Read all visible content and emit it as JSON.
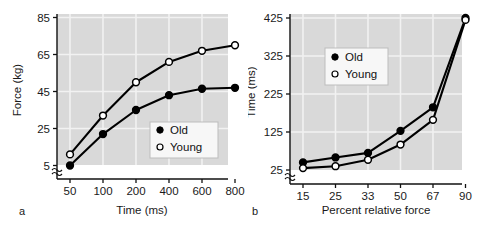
{
  "figure": {
    "background": "#ffffff",
    "plot_background": "#d9d9d9",
    "grid_color": "#f2f2f2",
    "line_color": "#000000"
  },
  "panels": [
    {
      "label": "a",
      "chart_data": {
        "type": "line",
        "title": "",
        "xlabel": "Time (ms)",
        "ylabel": "Force (kg)",
        "categories": [
          "50",
          "100",
          "200",
          "400",
          "600",
          "800"
        ],
        "yticks": [
          "5",
          "25",
          "45",
          "65",
          "85"
        ],
        "ylim": [
          5,
          85
        ],
        "ytick_values": [
          5,
          25,
          45,
          65,
          85
        ],
        "grid": true,
        "axis_break": true,
        "legend_position": "bottom-right",
        "series": [
          {
            "name": "Old",
            "marker": "filled-circle",
            "values": [
              5,
              22,
              35,
              43,
              46.5,
              47
            ]
          },
          {
            "name": "Young",
            "marker": "open-circle",
            "values": [
              11,
              32,
              50,
              61,
              67,
              70
            ]
          }
        ]
      },
      "legend": [
        {
          "label": "Old",
          "marker": "filled-circle"
        },
        {
          "label": "Young",
          "marker": "open-circle"
        }
      ]
    },
    {
      "label": "b",
      "chart_data": {
        "type": "line",
        "title": "",
        "xlabel": "Percent relative force",
        "ylabel": "Time (ms)",
        "categories": [
          "15",
          "25",
          "33",
          "50",
          "67",
          "90"
        ],
        "yticks": [
          "25",
          "125",
          "225",
          "325",
          "425"
        ],
        "ylim": [
          25,
          425
        ],
        "ytick_values": [
          25,
          125,
          225,
          325,
          425
        ],
        "grid": true,
        "axis_break": true,
        "legend_position": "top-center",
        "series": [
          {
            "name": "Old",
            "marker": "filled-circle",
            "values": [
              45,
              58,
              70,
              128,
              190,
              425
            ]
          },
          {
            "name": "Young",
            "marker": "open-circle",
            "values": [
              30,
              35,
              52,
              92,
              157,
              420
            ]
          }
        ]
      },
      "legend": [
        {
          "label": "Old",
          "marker": "filled-circle"
        },
        {
          "label": "Young",
          "marker": "open-circle"
        }
      ]
    }
  ]
}
